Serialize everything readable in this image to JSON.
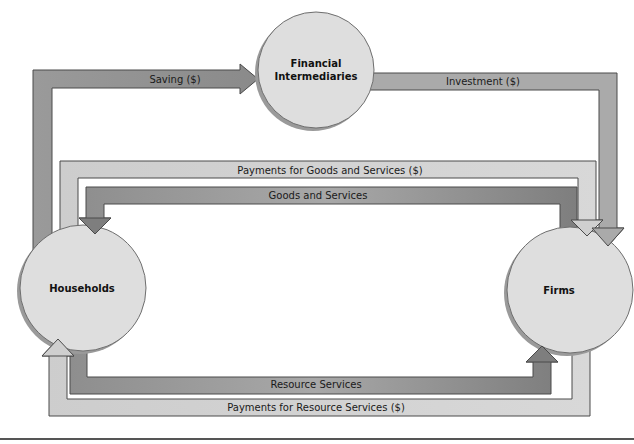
{
  "diagram": {
    "type": "circular-flow",
    "nodes": {
      "financial": {
        "line1": "Financial",
        "line2": "Intermediaries"
      },
      "households": {
        "label": "Households"
      },
      "firms": {
        "label": "Firms"
      }
    },
    "flows": {
      "saving": "Saving ($)",
      "investment": "Investment ($)",
      "payments_goods": "Payments for Goods and Services ($)",
      "goods": "Goods and Services",
      "resource": "Resource Services",
      "payments_resource": "Payments for Resource Services ($)"
    },
    "colors": {
      "circle_fill": "#dcdcdc",
      "circle_edge": "#7a7a7a",
      "dark_band": "#8c8c8c",
      "medium_band": "#a6a6a6",
      "light_band": "#cfcfcf",
      "band_edge": "#4a4a4a",
      "rule": "#555555"
    }
  }
}
